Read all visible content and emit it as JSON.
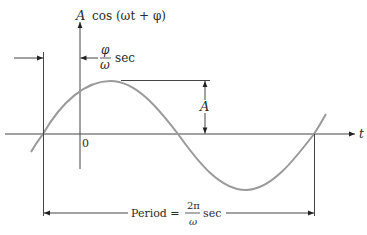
{
  "diagram": {
    "function_label": {
      "amplitude": "A",
      "expression": "cos (ωt + φ)"
    },
    "phase_label": {
      "numerator": "φ",
      "denominator": "ω",
      "unit": "sec"
    },
    "origin_label": "0",
    "time_axis_label": "t",
    "amplitude_label": "A",
    "period_label": {
      "prefix": "Period =",
      "numerator": "2π",
      "denominator": "ω",
      "unit": "sec"
    },
    "colors": {
      "curve": "#9a9a9a",
      "axes": "#333333",
      "text": "#2a2a2a"
    }
  }
}
